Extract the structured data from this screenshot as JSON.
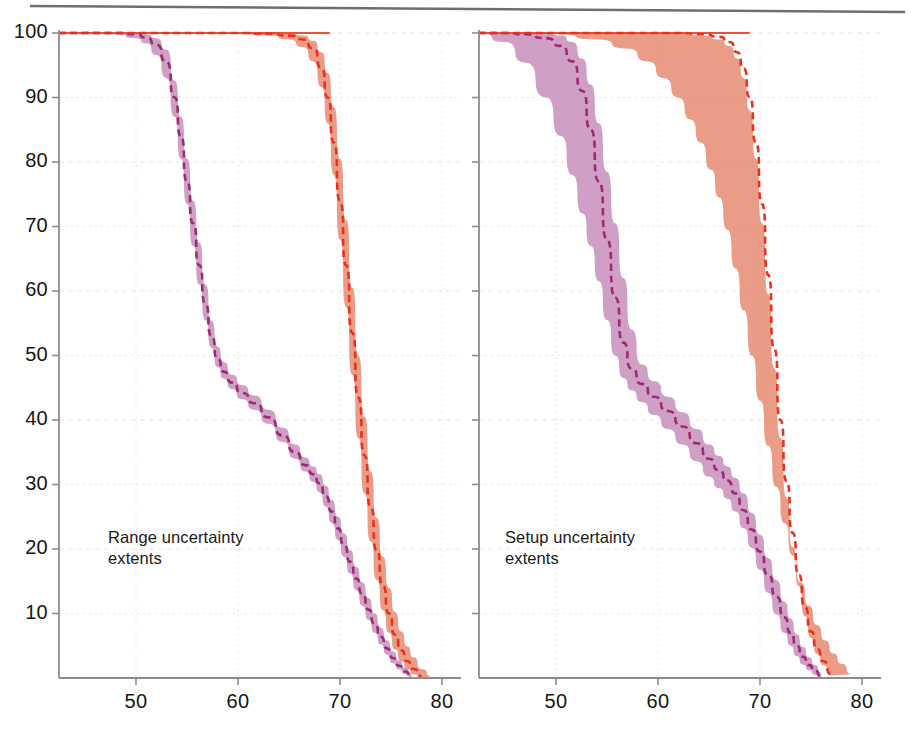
{
  "figure": {
    "background": "#ffffff",
    "top_rule_color": "#6e6e70",
    "axis_color": "#8d8d8f",
    "grid_color": "#e9e7e4",
    "tick_text_color": "#151515",
    "annotation_text_color": "#1a1a1a"
  },
  "colors": {
    "purple_band_fill": "#c892bd",
    "purple_line": "#9e2a72",
    "orange_band_fill": "#e9947c",
    "orange_line": "#e8321e",
    "pink_overlap": "#e94b6e"
  },
  "panels": [
    {
      "id": "left",
      "annotation": "Range uncertainty\nextents",
      "xlabel": "",
      "ylabel": "",
      "xticks": [
        50,
        60,
        70,
        80
      ],
      "yticks": [
        10,
        20,
        30,
        40,
        50,
        60,
        70,
        80,
        90,
        100
      ],
      "xlim": [
        42.4,
        83.5
      ],
      "ylim": [
        0,
        100
      ]
    },
    {
      "id": "right",
      "annotation": "Setup uncertainty\nextents",
      "xlabel": "",
      "ylabel": "",
      "xticks": [
        50,
        60,
        70,
        80
      ],
      "yticks": [
        10,
        20,
        30,
        40,
        50,
        60,
        70,
        80,
        90,
        100
      ],
      "xlim": [
        42.4,
        83.5
      ],
      "ylim": [
        0,
        100
      ]
    }
  ],
  "chart_data": {
    "type": "area",
    "title": "",
    "subtitle": "",
    "xlabel": "Dose (Gy)",
    "ylabel": "Volume (%)",
    "grid": true,
    "legend": "none",
    "xlim": [
      42.4,
      83.5
    ],
    "ylim": [
      0,
      100
    ],
    "xticks": [
      50,
      60,
      70,
      80
    ],
    "yticks": [
      10,
      20,
      30,
      40,
      50,
      60,
      70,
      80,
      90,
      100
    ],
    "panels": [
      {
        "name": "Range uncertainty extents",
        "annotation": "Range uncertainty\nextents",
        "series": [
          {
            "name": "purple-nominal",
            "color": "#9e2a72",
            "style": "dashed",
            "x": [
              42.4,
              46,
              48,
              50,
              51,
              52,
              53,
              53.8,
              54.4,
              55,
              55.6,
              56.2,
              56.8,
              57.4,
              58,
              58.6,
              59.4,
              60.4,
              61.6,
              63,
              64.4,
              65.6,
              66.6,
              67.4,
              68,
              68.6,
              69.2,
              69.8,
              70.4,
              71,
              71.6,
              72.2,
              72.8,
              73.4,
              74,
              74.6,
              75.2,
              75.8,
              76.4,
              77
            ],
            "y": [
              100,
              100,
              100,
              99.8,
              99.3,
              98.2,
              95.5,
              90,
              84,
              77,
              70.5,
              64,
              58,
              53,
              49.5,
              47.5,
              45.8,
              44.2,
              42.6,
              40.4,
              37.6,
              35,
              33,
              31.6,
              30.2,
              28.2,
              25.8,
              23.2,
              20.6,
              18,
              15.4,
              13,
              10.6,
              8.4,
              6.4,
              4.6,
              3.1,
              1.9,
              1.0,
              0.3
            ]
          },
          {
            "name": "purple-band-lower",
            "color": "#c892bd",
            "x": [
              42.4,
              46,
              48,
              50,
              51,
              52,
              53,
              53.8,
              54.4,
              55,
              55.6,
              56.2,
              56.8,
              57.4,
              58,
              58.6,
              59.4,
              60.4,
              61.6,
              63,
              64.4,
              65.6,
              66.6,
              67.4,
              68,
              68.6,
              69.2,
              69.8,
              70.4,
              71,
              71.6,
              72.2,
              72.8,
              73.4,
              74,
              74.6,
              75.2,
              75.8,
              76.4,
              77
            ],
            "y": [
              100,
              100,
              99.8,
              99.2,
              98.4,
              96.6,
              93.0,
              87.0,
              80.5,
              73.5,
              67.0,
              61.0,
              55.5,
              51.2,
              48.2,
              46.4,
              44.8,
              43.2,
              41.6,
              39.4,
              36.6,
              34.0,
              32.0,
              30.4,
              28.8,
              26.6,
              24.0,
              21.4,
              18.8,
              16.2,
              13.6,
              11.2,
              9.0,
              7.0,
              5.2,
              3.6,
              2.3,
              1.3,
              0.6,
              0.1
            ]
          },
          {
            "name": "purple-band-upper",
            "color": "#c892bd",
            "x": [
              42.4,
              46,
              48,
              50,
              51,
              52,
              53,
              53.8,
              54.4,
              55,
              55.6,
              56.2,
              56.8,
              57.4,
              58,
              58.6,
              59.4,
              60.4,
              61.6,
              63,
              64.4,
              65.6,
              66.6,
              67.4,
              68,
              68.6,
              69.2,
              69.8,
              70.4,
              71,
              71.6,
              72.2,
              72.8,
              73.4,
              74,
              74.6,
              75.2,
              75.8,
              76.4,
              77
            ],
            "y": [
              100,
              100,
              100,
              100,
              99.8,
              99.2,
              97.4,
              92.6,
              87.0,
              80.5,
              74.0,
              67.5,
              61.0,
              55.4,
              51.4,
              49.0,
              47.0,
              45.4,
              43.8,
              41.6,
              38.8,
              36.2,
              34.2,
              32.8,
              31.6,
              29.8,
              27.6,
              25.0,
              22.4,
              19.8,
              17.2,
              14.8,
              12.4,
              10.0,
              7.8,
              5.8,
              4.1,
              2.7,
              1.6,
              0.7
            ]
          },
          {
            "name": "orange-nominal",
            "color": "#e8321e",
            "style": "dashed",
            "x": [
              42.4,
              50,
              56,
              60,
              63,
              65,
              66.4,
              67.4,
              68.2,
              68.8,
              69.4,
              70,
              70.6,
              71.2,
              71.8,
              72.4,
              73,
              73.6,
              74.2,
              74.8,
              75.4,
              76,
              76.6,
              77.2,
              78
            ],
            "y": [
              100,
              100,
              100,
              100,
              99.9,
              99.6,
              99.0,
              97.6,
              94.5,
              90.0,
              83.0,
              74.0,
              64.0,
              53.5,
              43.5,
              34.5,
              26.5,
              19.8,
              14.3,
              10.0,
              6.7,
              4.3,
              2.6,
              1.4,
              0.3
            ]
          },
          {
            "name": "orange-band-lower",
            "color": "#e9947c",
            "x": [
              42.4,
              50,
              56,
              60,
              63,
              65,
              66.4,
              67.4,
              68.2,
              68.8,
              69.4,
              70,
              70.6,
              71.2,
              71.8,
              72.4,
              73,
              73.6,
              74.2,
              74.8,
              75.4,
              76,
              76.6,
              77.2,
              78
            ],
            "y": [
              100,
              100,
              100,
              99.9,
              99.6,
              99.0,
              97.8,
              95.6,
              91.6,
              86.0,
              78.0,
              68.0,
              57.5,
              47.0,
              37.2,
              28.6,
              21.2,
              15.2,
              10.5,
              7.0,
              4.4,
              2.6,
              1.4,
              0.6,
              0.0
            ]
          },
          {
            "name": "orange-band-upper",
            "color": "#e9947c",
            "x": [
              42.4,
              50,
              56,
              60,
              63,
              65,
              66.4,
              67.4,
              68.2,
              68.8,
              69.4,
              70,
              70.6,
              71.2,
              71.8,
              72.4,
              73,
              73.6,
              74.2,
              74.8,
              75.4,
              76,
              76.6,
              77.2,
              78,
              79
            ],
            "y": [
              100,
              100,
              100,
              100,
              100,
              99.9,
              99.6,
              98.8,
              97.0,
              93.8,
              88.5,
              80.5,
              71.0,
              60.5,
              50.0,
              40.5,
              32.0,
              24.8,
              18.8,
              14.0,
              10.2,
              7.2,
              4.9,
              3.2,
              1.4,
              0.3
            ]
          }
        ]
      },
      {
        "name": "Setup uncertainty extents",
        "annotation": "Setup uncertainty\nextents",
        "series": [
          {
            "name": "purple-nominal",
            "color": "#9e2a72",
            "style": "dashed",
            "x": [
              42.4,
              45,
              47,
              49,
              50.5,
              51.6,
              52.6,
              53.4,
              54.2,
              55,
              55.8,
              56.6,
              57.4,
              58.4,
              59.6,
              61,
              62.4,
              63.8,
              65,
              66,
              66.8,
              67.6,
              68.4,
              69.2,
              70,
              70.8,
              71.6,
              72.4,
              73,
              73.6,
              74.2,
              74.8,
              75.4,
              76
            ],
            "y": [
              100,
              100,
              99.8,
              99.2,
              98.0,
              95.6,
              91.0,
              85.0,
              77.0,
              68.0,
              59.0,
              52.0,
              48.0,
              45.6,
              43.6,
              41.4,
              39.0,
              36.4,
              34.0,
              32.2,
              30.6,
              28.6,
              26.0,
              23.0,
              19.6,
              16.0,
              12.6,
              9.4,
              7.0,
              5.0,
              3.3,
              2.0,
              1.1,
              0.3
            ]
          },
          {
            "name": "purple-band-lower",
            "color": "#c892bd",
            "x": [
              42.4,
              45,
              47,
              49,
              50.5,
              51.6,
              52.6,
              53.4,
              54.2,
              55,
              55.8,
              56.6,
              57.4,
              58.4,
              59.6,
              61,
              62.4,
              63.8,
              65,
              66,
              66.8,
              67.6,
              68.4,
              69.2,
              70,
              70.8,
              71.6,
              72.4,
              73,
              73.6,
              74.2,
              74.8,
              75.4,
              76
            ],
            "y": [
              100,
              98.6,
              95.4,
              90.0,
              84.0,
              78.0,
              72.0,
              67.0,
              61.5,
              55.5,
              50.0,
              46.5,
              44.6,
              42.8,
              40.8,
              38.6,
              36.2,
              33.6,
              31.2,
              29.4,
              27.8,
              25.8,
              23.2,
              20.2,
              16.8,
              13.2,
              9.9,
              7.0,
              5.0,
              3.4,
              2.1,
              1.2,
              0.5,
              0.0
            ]
          },
          {
            "name": "purple-band-upper",
            "color": "#c892bd",
            "x": [
              42.4,
              45,
              47,
              49,
              50.5,
              51.6,
              52.6,
              53.4,
              54.2,
              55,
              55.8,
              56.6,
              57.4,
              58.4,
              59.6,
              61,
              62.4,
              63.8,
              65,
              66,
              66.8,
              67.6,
              68.4,
              69.2,
              70,
              70.8,
              71.6,
              72.4,
              73,
              73.6,
              74.2,
              74.8,
              75.4,
              76
            ],
            "y": [
              100,
              100,
              100,
              100,
              99.6,
              98.6,
              96.0,
              92.0,
              86.0,
              78.5,
              70.5,
              62.0,
              54.0,
              48.6,
              46.0,
              43.6,
              41.2,
              38.6,
              36.2,
              34.4,
              32.8,
              31.0,
              28.6,
              25.6,
              22.2,
              18.6,
              15.2,
              11.8,
              9.2,
              6.8,
              4.8,
              3.2,
              2.0,
              0.8
            ]
          },
          {
            "name": "orange-nominal",
            "color": "#e8321e",
            "style": "dashed",
            "x": [
              42.4,
              52,
              58,
              62,
              64.5,
              66,
              67,
              67.8,
              68.4,
              69,
              69.6,
              70.2,
              70.8,
              71.4,
              72,
              72.6,
              73.2,
              73.8,
              74.4,
              75,
              75.6,
              76.2,
              77
            ],
            "y": [
              100,
              100,
              100,
              100,
              99.8,
              99.4,
              98.6,
              97.0,
              94.5,
              90.0,
              83.0,
              73.5,
              62.5,
              51.0,
              40.0,
              30.5,
              22.5,
              16.0,
              11.0,
              7.2,
              4.5,
              2.6,
              0.6
            ]
          },
          {
            "name": "orange-band-lower",
            "color": "#e9947c",
            "x": [
              42.4,
              52,
              58,
              62,
              64.5,
              66,
              67,
              67.8,
              68.4,
              69,
              69.6,
              70.2,
              70.8,
              71.4,
              72,
              72.6,
              73.2,
              73.8,
              74.4,
              75,
              75.6,
              76.2,
              77
            ],
            "y": [
              100,
              100,
              100,
              99.9,
              99.6,
              99.0,
              98.0,
              96.0,
              93.0,
              88.0,
              80.5,
              70.5,
              59.5,
              48.0,
              37.2,
              28.0,
              20.3,
              14.2,
              9.6,
              6.2,
              3.7,
              2.0,
              0.4
            ]
          },
          {
            "name": "orange-band-upper",
            "color": "#e9947c",
            "x": [
              42.4,
              50,
              54,
              57,
              59,
              60.6,
              62,
              63.2,
              64.2,
              65.2,
              66,
              66.8,
              67.6,
              68.4,
              69.2,
              70,
              70.8,
              71.6,
              72.4,
              73.2,
              74,
              74.8,
              75.6,
              76.4,
              77.2,
              78,
              79
            ],
            "y": [
              100,
              99.8,
              99.0,
              97.6,
              95.6,
              93.0,
              90.0,
              86.6,
              83.0,
              78.8,
              74.5,
              69.5,
              63.5,
              57.0,
              50.0,
              43.0,
              36.0,
              29.6,
              24.0,
              19.0,
              14.8,
              11.2,
              8.2,
              5.8,
              3.8,
              2.2,
              0.6
            ]
          }
        ]
      }
    ]
  },
  "axes_labels": {
    "left_yticks": [
      "100",
      "90",
      "80",
      "70",
      "60",
      "50",
      "40",
      "30",
      "20",
      "10"
    ],
    "left_xticks": [
      "50",
      "60",
      "70",
      "80"
    ],
    "right_xticks": [
      "50",
      "60",
      "70",
      "80"
    ]
  }
}
